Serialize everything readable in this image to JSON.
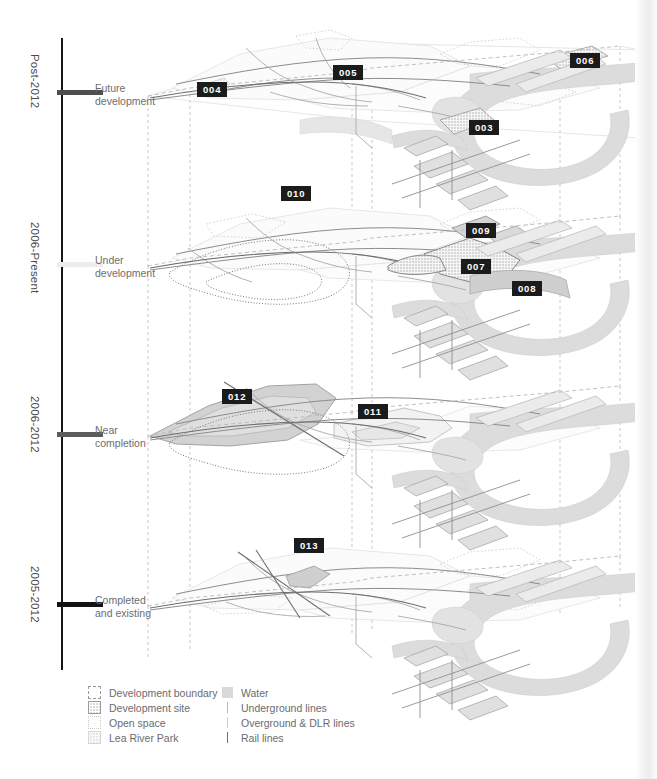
{
  "colors": {
    "badge_bg": "#1b1b1b",
    "badge_text": "#ffffff",
    "axis": "#151515",
    "water": "#d9d9d9",
    "development_site": "#dcdcdc",
    "rail_line": "#6e6e6e",
    "underground_line": "#b9b9b9",
    "overground_line": "#cfcfcf",
    "text": "#6b6b6e"
  },
  "timeline": {
    "periods": [
      {
        "era": "Post-2012",
        "stage": "Future\ndevelopment",
        "stage_line1": "Future",
        "stage_line2": "development",
        "tick_color": "#4f4f4f"
      },
      {
        "era": "2006-Present",
        "stage": "Under\ndevelopment",
        "stage_line1": "Under",
        "stage_line2": "development",
        "tick_color": "#ededed"
      },
      {
        "era": "2006-2012",
        "stage": "Near\ncompletion",
        "stage_line1": "Near",
        "stage_line2": "completion",
        "tick_color": "#5c5c5c"
      },
      {
        "era": "2005-2012",
        "stage": "Completed\nand existing",
        "stage_line1": "Completed",
        "stage_line2": "and existing",
        "tick_color": "#131313"
      }
    ]
  },
  "map_layers": [
    {
      "period": "Post-2012",
      "stage": "Future development",
      "markers": [
        {
          "id": "004",
          "x": 197,
          "y": 82
        },
        {
          "id": "005",
          "x": 333,
          "y": 65
        },
        {
          "id": "006",
          "x": 570,
          "y": 53
        },
        {
          "id": "003",
          "x": 469,
          "y": 120
        }
      ]
    },
    {
      "period": "2006-Present",
      "stage": "Under development",
      "markers": [
        {
          "id": "010",
          "x": 281,
          "y": 186
        },
        {
          "id": "009",
          "x": 466,
          "y": 223
        },
        {
          "id": "007",
          "x": 461,
          "y": 259
        },
        {
          "id": "008",
          "x": 512,
          "y": 281
        }
      ]
    },
    {
      "period": "2006-2012",
      "stage": "Near completion",
      "markers": [
        {
          "id": "012",
          "x": 222,
          "y": 389
        },
        {
          "id": "011",
          "x": 358,
          "y": 404
        }
      ]
    },
    {
      "period": "2005-2012",
      "stage": "Completed and existing",
      "markers": [
        {
          "id": "013",
          "x": 294,
          "y": 538
        }
      ]
    }
  ],
  "legend": {
    "left_column": [
      {
        "swatch": "development-boundary-swatch",
        "label": "Development boundary"
      },
      {
        "swatch": "development-site-swatch",
        "label": "Development site"
      },
      {
        "swatch": "open-space-swatch",
        "label": "Open space"
      },
      {
        "swatch": "lea-river-park-swatch",
        "label": "Lea River Park"
      }
    ],
    "right_column": [
      {
        "swatch": "water-swatch",
        "label": "Water"
      },
      {
        "swatch": "underground-lines-swatch",
        "label": "Underground lines"
      },
      {
        "swatch": "overground-dlr-lines-swatch",
        "label": "Overground & DLR lines"
      },
      {
        "swatch": "rail-lines-swatch",
        "label": "Rail lines"
      }
    ]
  }
}
